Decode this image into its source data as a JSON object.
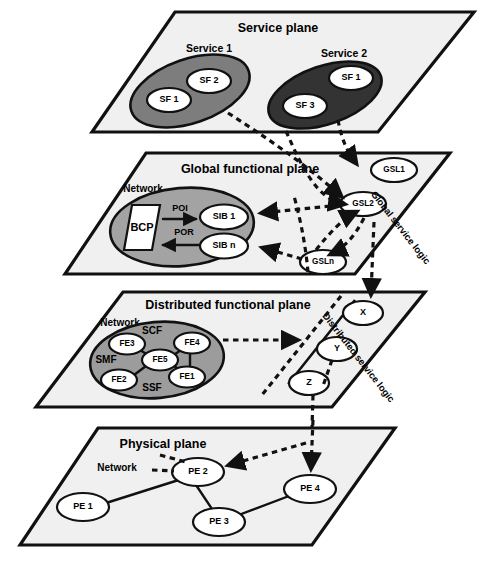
{
  "diagram": {
    "planes": [
      {
        "id": "service-plane",
        "title": "Service plane",
        "services": [
          {
            "label": "Service 1",
            "fill": "#7d7d7d",
            "features": [
              "SF 1",
              "SF 2"
            ]
          },
          {
            "label": "Service 2",
            "fill": "#333333",
            "features": [
              "SF 3",
              "SF 1"
            ]
          }
        ]
      },
      {
        "id": "global-functional-plane",
        "title": "Global functional plane",
        "network_label": "Network",
        "bcp_label": "BCP",
        "flows": [
          "POI",
          "POR"
        ],
        "sibs": [
          "SIB 1",
          "SIB n"
        ],
        "side_label": "Global service logic",
        "gsl_nodes": [
          "GSL1",
          "GSL2",
          "GSLn"
        ]
      },
      {
        "id": "distributed-functional-plane",
        "title": "Distributed functional plane",
        "network_label": "Network",
        "regions": [
          "SCF",
          "SMF",
          "SSF"
        ],
        "fe_nodes": [
          "FE1",
          "FE2",
          "FE3",
          "FE4",
          "FE5"
        ],
        "side_label": "Distributed service logic",
        "dsl_nodes": [
          "X",
          "Y",
          "Z"
        ]
      },
      {
        "id": "physical-plane",
        "title": "Physical plane",
        "network_label": "Network",
        "pe_nodes": [
          "PE 1",
          "PE 2",
          "PE 3",
          "PE 4"
        ]
      }
    ],
    "colors": {
      "plane_face": "#f0f0f0",
      "outline": "#111111",
      "service1_fill": "#7d7d7d",
      "service2_fill": "#333333",
      "network_fill": "#a3a3a3",
      "fe_cluster_fill": "#9c9c9c",
      "node_fill": "#ffffff"
    }
  }
}
